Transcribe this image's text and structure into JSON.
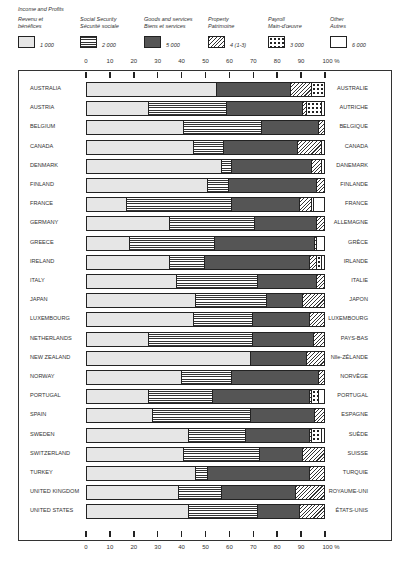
{
  "legend": {
    "title": "Income and Profits",
    "items": [
      {
        "key": "income",
        "label_en": "Revenu et",
        "label_fr": "bénéfices",
        "value": "1 000",
        "pattern": "p-income"
      },
      {
        "key": "ss",
        "label_en": "Social Security",
        "label_fr": "Sécurité sociale",
        "value": "2 000",
        "pattern": "p-ss"
      },
      {
        "key": "goods",
        "label_en": "Goods and services",
        "label_fr": "Biens et services",
        "value": "5 000",
        "pattern": "p-goods"
      },
      {
        "key": "property",
        "label_en": "Property",
        "label_fr": "Patrimoine",
        "value": "4 (1-3)",
        "pattern": "p-property"
      },
      {
        "key": "payroll",
        "label_en": "Payroll",
        "label_fr": "Main-d'œuvre",
        "value": "3 000",
        "pattern": "p-payroll"
      },
      {
        "key": "other",
        "label_en": "Other",
        "label_fr": "Autres",
        "value": "6 000",
        "pattern": "p-other"
      }
    ]
  },
  "axis": {
    "ticks": [
      "0",
      "10",
      "20",
      "30",
      "40",
      "50",
      "60",
      "70",
      "80",
      "90",
      "100 %"
    ]
  },
  "chart_data": {
    "type": "bar",
    "orientation": "horizontal",
    "stacked": true,
    "xlabel": "%",
    "ylabel": "",
    "xlim": [
      0,
      100
    ],
    "legend_position": "top",
    "grid": false,
    "series_names": [
      "Income and Profits (1 000)",
      "Social Security (2 000)",
      "Goods and services (5 000)",
      "Property (4 (1-3))",
      "Payroll (3 000)",
      "Other (6 000)"
    ],
    "categories": [
      "AUSTRALIA",
      "AUSTRIA",
      "BELGIUM",
      "CANADA",
      "DENMARK",
      "FINLAND",
      "FRANCE",
      "GERMANY",
      "GREECE",
      "IRELAND",
      "ITALY",
      "JAPAN",
      "LUXEMBOURG",
      "NETHERLANDS",
      "NEW ZEALAND",
      "NORWAY",
      "PORTUGAL",
      "SPAIN",
      "SWEDEN",
      "SWITZERLAND",
      "TURKEY",
      "UNITED KINGDOM",
      "UNITED STATES"
    ],
    "categories_fr": [
      "AUSTRALIE",
      "AUTRICHE",
      "BELGIQUE",
      "CANADA",
      "DANEMARK",
      "FINLANDE",
      "FRANCE",
      "ALLEMAGNE",
      "GRÈCE",
      "IRLANDE",
      "ITALIE",
      "JAPON",
      "LUXEMBOURG",
      "PAYS-BAS",
      "Nlle-ZÉLANDE",
      "NORVÈGE",
      "PORTUGAL",
      "ESPAGNE",
      "SUÈDE",
      "SUISSE",
      "TURQUIE",
      "ROYAUME-UNI",
      "ÉTATS-UNIS"
    ],
    "series": [
      {
        "name": "Income and Profits",
        "values": [
          55,
          26,
          41,
          45,
          57,
          51,
          17,
          35,
          18,
          35,
          38,
          46,
          45,
          26,
          69,
          40,
          26,
          28,
          43,
          41,
          46,
          39,
          43
        ]
      },
      {
        "name": "Social Security",
        "values": [
          0,
          33,
          33,
          13,
          4,
          9,
          44,
          36,
          36,
          15,
          34,
          30,
          25,
          44,
          0,
          21,
          27,
          41,
          24,
          32,
          5,
          18,
          29
        ]
      },
      {
        "name": "Goods and services",
        "values": [
          31,
          32,
          24,
          31,
          34,
          37,
          29,
          26,
          42,
          44,
          25,
          15,
          24,
          26,
          24,
          37,
          41,
          27,
          27,
          18,
          43,
          31,
          18
        ]
      },
      {
        "name": "Property",
        "values": [
          9,
          2,
          2,
          10,
          4,
          3,
          5,
          3,
          1,
          3,
          3,
          9,
          6,
          4,
          7,
          2,
          1,
          4,
          1,
          9,
          6,
          12,
          10
        ]
      },
      {
        "name": "Payroll",
        "values": [
          5,
          6,
          0,
          0,
          0,
          0,
          1,
          0,
          0,
          2,
          0,
          0,
          0,
          0,
          0,
          0,
          3,
          0,
          4,
          0,
          0,
          0,
          0
        ]
      },
      {
        "name": "Other",
        "values": [
          0,
          1,
          0,
          1,
          1,
          0,
          4,
          0,
          3,
          1,
          0,
          0,
          0,
          0,
          0,
          0,
          2,
          0,
          1,
          0,
          0,
          0,
          0
        ]
      }
    ]
  }
}
